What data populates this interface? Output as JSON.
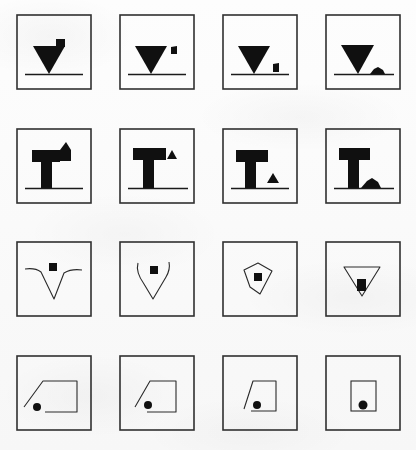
{
  "figure": {
    "grid": {
      "rows": 4,
      "columns": 4,
      "cell_px": 76
    },
    "colors": {
      "background": "#fbfbfb",
      "frame_border": "#303030",
      "fill_solid": "#101010",
      "outline_stroke": "#2a2a2a",
      "ground_line": "#1a1a1a"
    },
    "rows": [
      {
        "row_index": 1,
        "row_name": "filled-inverted-triangle-sequence",
        "description": "Filled inverted triangle resting on a ground line; a small block detaches from the upper right, falls, and settles as debris on the ground.",
        "cells": [
          {
            "cell_index": 1,
            "label": "triangle-with-attached-block",
            "fragment_state": "attached-top-right"
          },
          {
            "cell_index": 2,
            "label": "triangle-with-block-detached",
            "fragment_state": "detached-mid-air-high"
          },
          {
            "cell_index": 3,
            "label": "triangle-with-block-falling",
            "fragment_state": "falling-near-ground"
          },
          {
            "cell_index": 4,
            "label": "triangle-with-debris-on-ground",
            "fragment_state": "settled-debris-pile"
          }
        ]
      },
      {
        "row_index": 2,
        "row_name": "filled-t-shape-sequence",
        "description": "Filled T-shaped column on a ground line; a triangular fragment separates from the right of the cap, falls, and collapses into a low pile beside the base.",
        "cells": [
          {
            "cell_index": 1,
            "label": "t-shape-with-attached-fragment",
            "fragment_state": "attached-cap-right"
          },
          {
            "cell_index": 2,
            "label": "t-shape-with-fragment-detached",
            "fragment_state": "detached-mid-air-high"
          },
          {
            "cell_index": 3,
            "label": "t-shape-with-fragment-falling",
            "fragment_state": "falling-near-ground"
          },
          {
            "cell_index": 4,
            "label": "t-shape-with-debris-on-ground",
            "fragment_state": "settled-debris-pile"
          }
        ]
      },
      {
        "row_index": 3,
        "row_name": "outline-v-closing-sequence",
        "description": "Open outline V / funnel curve around a small filled square; across the sequence the outline closes into a triangle and the square descends to the apex.",
        "cells": [
          {
            "cell_index": 1,
            "label": "wide-open-v-outline",
            "closure": "open-splayed",
            "marker": "square-centered-high"
          },
          {
            "cell_index": 2,
            "label": "narrowing-u-outline",
            "closure": "partially-closed",
            "marker": "square-centered"
          },
          {
            "cell_index": 3,
            "label": "closed-pentagon-outline",
            "closure": "nearly-closed",
            "marker": "square-centered-low"
          },
          {
            "cell_index": 4,
            "label": "closed-triangle-outline",
            "closure": "closed-triangle",
            "marker": "square-at-apex"
          }
        ]
      },
      {
        "row_index": 4,
        "row_name": "outline-quad-closing-sequence",
        "description": "Open quadrilateral outline with a slanted left edge beside a filled dot; across the sequence the slant steepens and the outline closes into an upright rectangle enclosing the dot.",
        "cells": [
          {
            "cell_index": 1,
            "label": "wide-slanted-open-quad",
            "closure": "open-wide-slant",
            "marker": "dot-outside-left"
          },
          {
            "cell_index": 2,
            "label": "narrower-slanted-quad",
            "closure": "narrowing-slant",
            "marker": "dot-at-opening"
          },
          {
            "cell_index": 3,
            "label": "steep-slanted-quad",
            "closure": "steep-slant",
            "marker": "dot-inside-edge"
          },
          {
            "cell_index": 4,
            "label": "closed-upright-rectangle",
            "closure": "closed-rectangle",
            "marker": "dot-enclosed"
          }
        ]
      }
    ]
  }
}
